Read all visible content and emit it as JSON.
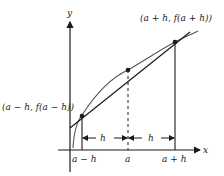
{
  "diagram": {
    "axes": {
      "x_label": "x",
      "y_label": "y"
    },
    "points": {
      "left": {
        "label": "(a − h, f(a − h))"
      },
      "middle": {
        "label": ""
      },
      "right": {
        "label": "(a + h, f(a + h))"
      }
    },
    "ticks": [
      "a − h",
      "a",
      "a + h"
    ],
    "spans": [
      "h",
      "h"
    ],
    "colors": {
      "ink": "#1a1a1a",
      "curve": "#555555"
    }
  }
}
